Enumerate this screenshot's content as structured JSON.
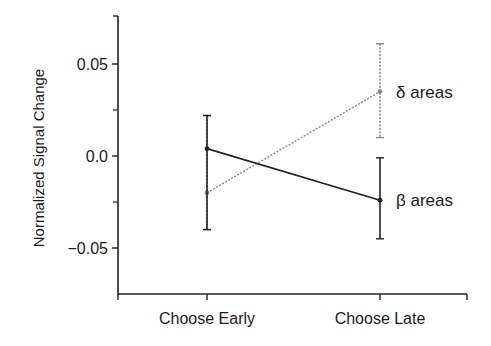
{
  "chart_data": {
    "type": "line",
    "title": "",
    "xlabel": "",
    "ylabel": "Normalized Signal Change",
    "categories": [
      "Choose Early",
      "Choose Late"
    ],
    "ylim": [
      -0.075,
      0.075
    ],
    "yticks": [
      {
        "value": 0.05,
        "label": "0.05"
      },
      {
        "value": 0.0,
        "label": "0.0"
      },
      {
        "value": -0.05,
        "label": "-0.05"
      }
    ],
    "minor_yticks": [
      0.025,
      -0.025
    ],
    "grid": false,
    "legend": "inline labels at right end of each line",
    "series": [
      {
        "name": "δ areas",
        "style": "dotted gray",
        "color": "#8a8a8a",
        "values": [
          -0.02,
          0.035
        ],
        "error_low": [
          -0.04,
          0.01
        ],
        "error_high": [
          0.022,
          0.061
        ]
      },
      {
        "name": "β areas",
        "style": "solid black",
        "color": "#222222",
        "values": [
          0.004,
          -0.024
        ],
        "error_low": [
          -0.04,
          -0.045
        ],
        "error_high": [
          0.022,
          -0.001
        ]
      }
    ]
  }
}
